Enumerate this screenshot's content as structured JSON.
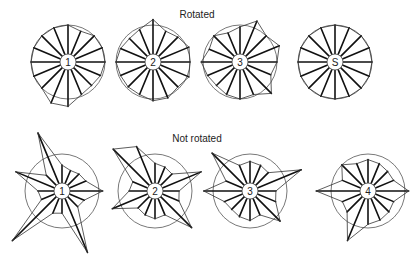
{
  "sections": [
    {
      "title": "Rotated",
      "figures": [
        {
          "label": "1",
          "spoke_ratios": [
            1.0,
            0.9,
            1.0,
            1.0,
            1.0,
            0.95,
            0.9,
            0.95,
            1.2,
            1.2,
            1.0,
            1.0,
            1.0,
            1.0,
            1.0,
            1.0
          ]
        },
        {
          "label": "2",
          "spoke_ratios": [
            1.15,
            0.9,
            0.95,
            1.05,
            1.0,
            1.05,
            0.95,
            1.05,
            1.05,
            0.95,
            0.95,
            0.95,
            1.0,
            0.95,
            0.9,
            0.95
          ]
        },
        {
          "label": "3",
          "spoke_ratios": [
            0.95,
            1.2,
            1.0,
            1.15,
            1.0,
            0.9,
            1.2,
            0.95,
            1.0,
            0.95,
            0.9,
            0.95,
            1.05,
            0.9,
            1.0,
            0.85
          ]
        },
        {
          "label": "S",
          "spoke_ratios": [
            1.0,
            1.0,
            1.0,
            1.0,
            1.0,
            1.0,
            1.0,
            1.0,
            1.0,
            1.0,
            1.0,
            1.0,
            1.0,
            1.0,
            1.0,
            1.0
          ]
        }
      ]
    },
    {
      "title": "Not rotated",
      "figures": [
        {
          "label": "1",
          "spoke_ratios": [
            0.7,
            0.6,
            0.65,
            0.7,
            1.1,
            0.65,
            0.6,
            1.8,
            0.6,
            0.65,
            1.9,
            0.6,
            0.65,
            1.35,
            0.6,
            1.7
          ]
        },
        {
          "label": "2",
          "spoke_ratios": [
            0.75,
            0.7,
            0.65,
            1.35,
            0.65,
            0.7,
            1.4,
            0.7,
            0.75,
            0.7,
            0.65,
            1.25,
            0.7,
            0.65,
            1.6,
            1.3
          ]
        },
        {
          "label": "3",
          "spoke_ratios": [
            0.8,
            0.75,
            0.7,
            1.5,
            0.7,
            0.75,
            1.15,
            0.7,
            0.8,
            0.75,
            0.7,
            0.75,
            1.25,
            0.7,
            1.45,
            0.75
          ]
        },
        {
          "label": "4",
          "spoke_ratios": [
            0.85,
            0.8,
            0.75,
            0.75,
            1.1,
            0.75,
            0.8,
            0.85,
            0.9,
            1.45,
            0.8,
            0.75,
            1.4,
            0.75,
            1.0,
            0.8
          ]
        }
      ]
    }
  ]
}
